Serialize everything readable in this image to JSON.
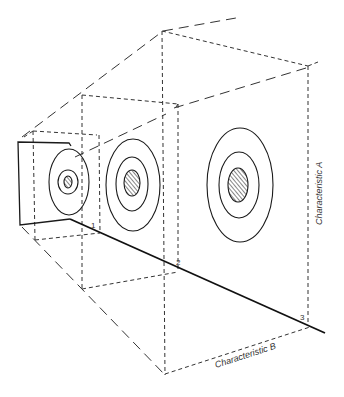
{
  "diagram": {
    "type": "perspective-planes",
    "axis_labels": {
      "vertical": "Characteristic A",
      "horizontal": "Characteristic B"
    },
    "plane_markers": [
      "1",
      "2",
      "3"
    ],
    "planes": [
      {
        "id": "1",
        "description": "small plane with small elliptical contour rings"
      },
      {
        "id": "2",
        "description": "medium plane with three concentric elliptical contours, hatched core"
      },
      {
        "id": "3",
        "description": "large plane with three concentric elliptical contours, hatched core"
      }
    ],
    "colors": {
      "line": "#1a1a1a",
      "dash": "#333333",
      "background": "#ffffff"
    }
  }
}
